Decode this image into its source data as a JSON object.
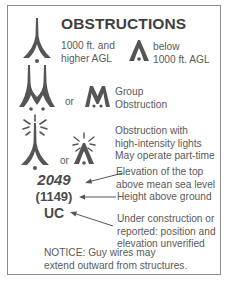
{
  "legend": {
    "title": "OBSTRUCTIONS",
    "high_obstruction": {
      "line1": "1000 ft. and",
      "line2": "higher AGL",
      "icon": "tall-obstruction-icon"
    },
    "low_obstruction": {
      "line1": "below",
      "line2": "1000 ft. AGL",
      "icon": "short-obstruction-icon"
    },
    "group": {
      "or_label": "or",
      "line1": "Group",
      "line2": "Obstruction",
      "icons": [
        "tall-group-obstruction-icon",
        "short-group-obstruction-icon"
      ]
    },
    "lighted": {
      "or_label": "or",
      "line1": "Obstruction with",
      "line2": "high-intensity lights",
      "line3": "May operate part-time",
      "icons": [
        "tall-lighted-obstruction-icon",
        "short-lighted-obstruction-icon"
      ]
    },
    "elevation": {
      "value": "2049",
      "line1": "Elevation of the top",
      "line2": "above mean sea level"
    },
    "height": {
      "value": "(1149)",
      "line1": "Height above ground"
    },
    "under_construction": {
      "value": "UC",
      "line1": "Under construction or",
      "line2": "reported:  position and",
      "line3": "elevation unverified"
    },
    "notice": {
      "line1": "NOTICE:  Guy wires may",
      "line2": "extend outward from structures."
    }
  },
  "colors": {
    "symbol": "#555555",
    "text": "#5a5a5a",
    "border": "#8a8a8a"
  }
}
